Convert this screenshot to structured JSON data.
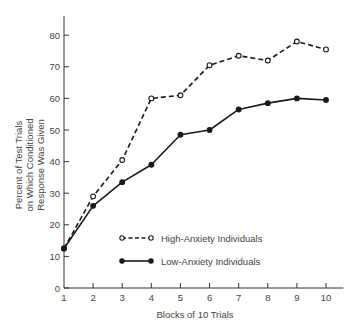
{
  "chart_data": {
    "type": "line",
    "title": "",
    "xlabel": "Blocks of 10 Trials",
    "ylabel_lines": [
      "Percent of Test Trials",
      "on Which Conditioned",
      "Response Was Given"
    ],
    "ylabel": "Percent of Test Trials on Which Conditioned Response Was Given",
    "x": [
      1,
      2,
      3,
      4,
      5,
      6,
      7,
      8,
      9,
      10
    ],
    "x_ticks": [
      "1",
      "2",
      "3",
      "4",
      "5",
      "6",
      "7",
      "8",
      "9",
      "10"
    ],
    "y_ticks": [
      "0",
      "10",
      "20",
      "30",
      "40",
      "50",
      "60",
      "70",
      "80"
    ],
    "xlim": [
      1,
      10.6
    ],
    "ylim": [
      0,
      86
    ],
    "grid": false,
    "legend_position": "bottom-center",
    "series": [
      {
        "name": "High-Anxiety Individuals",
        "style": "dashed",
        "marker": "open-circle",
        "values": [
          12.5,
          29,
          40.5,
          60,
          61,
          70.5,
          73.5,
          72,
          78,
          75.5
        ]
      },
      {
        "name": "Low-Anxiety Individuals",
        "style": "solid",
        "marker": "filled-circle",
        "values": [
          12.5,
          26,
          33.5,
          39,
          48.5,
          50,
          56.5,
          58.5,
          60,
          59.5
        ]
      }
    ],
    "colors": {
      "line": "#1a1a1a",
      "axis": "#333333",
      "text": "#444444"
    }
  }
}
